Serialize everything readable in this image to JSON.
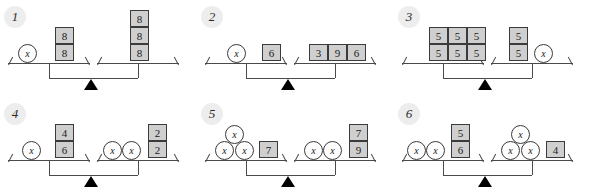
{
  "diagram": {
    "variable_label": "x",
    "panel_count": 6,
    "colors": {
      "box_fill": "#cfcfcf",
      "box_border": "#3b3b3b",
      "circle_fill": "#fdfdfd",
      "circle_border": "#3b3b3b",
      "scale_line": "#4a4a4a",
      "fulcrum": "#000000",
      "badge_fill": "#ededed",
      "background": "#ffffff"
    },
    "panels": [
      {
        "number": "1",
        "left": {
          "circles": [
            {
              "label": "x",
              "x": 18,
              "y": 44
            }
          ],
          "boxes": [
            {
              "label": "8",
              "x": 55,
              "y": 27
            },
            {
              "label": "8",
              "x": 55,
              "y": 44
            }
          ]
        },
        "right": {
          "circles": [],
          "boxes": [
            {
              "label": "8",
              "x": 130,
              "y": 10
            },
            {
              "label": "8",
              "x": 130,
              "y": 27
            },
            {
              "label": "8",
              "x": 130,
              "y": 44
            }
          ]
        }
      },
      {
        "number": "2",
        "left": {
          "circles": [
            {
              "label": "x",
              "x": 30,
              "y": 44
            }
          ],
          "boxes": [
            {
              "label": "6",
              "x": 65,
              "y": 44
            }
          ]
        },
        "right": {
          "circles": [],
          "boxes": [
            {
              "label": "3",
              "x": 112,
              "y": 44
            },
            {
              "label": "9",
              "x": 131,
              "y": 44
            },
            {
              "label": "6",
              "x": 150,
              "y": 44
            }
          ]
        }
      },
      {
        "number": "3",
        "left": {
          "circles": [],
          "boxes": [
            {
              "label": "5",
              "x": 35,
              "y": 27
            },
            {
              "label": "5",
              "x": 54,
              "y": 27
            },
            {
              "label": "5",
              "x": 73,
              "y": 27
            },
            {
              "label": "5",
              "x": 35,
              "y": 44
            },
            {
              "label": "5",
              "x": 54,
              "y": 44
            },
            {
              "label": "5",
              "x": 73,
              "y": 44
            }
          ]
        },
        "right": {
          "circles": [
            {
              "label": "x",
              "x": 140,
              "y": 44
            }
          ],
          "boxes": [
            {
              "label": "5",
              "x": 115,
              "y": 27
            },
            {
              "label": "5",
              "x": 115,
              "y": 44
            }
          ]
        }
      },
      {
        "number": "4",
        "left": {
          "circles": [
            {
              "label": "x",
              "x": 22,
              "y": 44
            }
          ],
          "boxes": [
            {
              "label": "4",
              "x": 55,
              "y": 27
            },
            {
              "label": "6",
              "x": 55,
              "y": 44
            }
          ]
        },
        "right": {
          "circles": [
            {
              "label": "x",
              "x": 103,
              "y": 44
            },
            {
              "label": "x",
              "x": 122,
              "y": 44
            }
          ],
          "boxes": [
            {
              "label": "2",
              "x": 148,
              "y": 27
            },
            {
              "label": "2",
              "x": 148,
              "y": 44
            }
          ]
        }
      },
      {
        "number": "5",
        "left": {
          "circles": [
            {
              "label": "x",
              "x": 28,
              "y": 28
            },
            {
              "label": "x",
              "x": 18,
              "y": 44
            },
            {
              "label": "x",
              "x": 38,
              "y": 44
            }
          ],
          "boxes": [
            {
              "label": "7",
              "x": 62,
              "y": 44
            }
          ]
        },
        "right": {
          "circles": [
            {
              "label": "x",
              "x": 107,
              "y": 44
            },
            {
              "label": "x",
              "x": 126,
              "y": 44
            }
          ],
          "boxes": [
            {
              "label": "7",
              "x": 152,
              "y": 27
            },
            {
              "label": "9",
              "x": 152,
              "y": 44
            }
          ]
        }
      },
      {
        "number": "6",
        "left": {
          "circles": [
            {
              "label": "x",
              "x": 13,
              "y": 44
            },
            {
              "label": "x",
              "x": 32,
              "y": 44
            }
          ],
          "boxes": [
            {
              "label": "5",
              "x": 57,
              "y": 27
            },
            {
              "label": "6",
              "x": 57,
              "y": 44
            }
          ]
        },
        "right": {
          "circles": [
            {
              "label": "x",
              "x": 117,
              "y": 28
            },
            {
              "label": "x",
              "x": 107,
              "y": 44
            },
            {
              "label": "x",
              "x": 127,
              "y": 44
            }
          ],
          "boxes": [
            {
              "label": "4",
              "x": 152,
              "y": 44
            }
          ]
        }
      }
    ],
    "geometry": {
      "panel_width": 197,
      "panel_height": 96,
      "left_pan_x": 8,
      "left_pan_w": 82,
      "right_pan_x": 97,
      "right_pan_w": 82,
      "pan_y": 63,
      "beam_y": 78,
      "drop_h": 15,
      "fulcrum_x": 91,
      "fulcrum_y": 78,
      "panel_origins": [
        {
          "x": 0,
          "y": 0
        },
        {
          "x": 197,
          "y": 0
        },
        {
          "x": 394,
          "y": 0
        },
        {
          "x": 0,
          "y": 97
        },
        {
          "x": 197,
          "y": 97
        },
        {
          "x": 394,
          "y": 97
        }
      ]
    }
  }
}
